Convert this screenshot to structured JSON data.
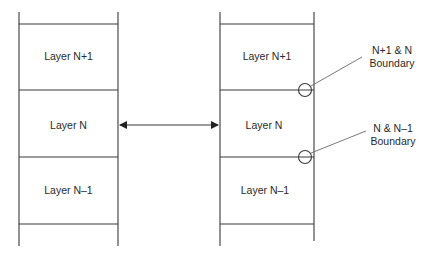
{
  "diagram": {
    "type": "protocol-layer-stack",
    "left_stack": {
      "layers": [
        {
          "label": "Layer N+1"
        },
        {
          "label": "Layer N"
        },
        {
          "label": "Layer N–1"
        }
      ]
    },
    "right_stack": {
      "layers": [
        {
          "label": "Layer N+1"
        },
        {
          "label": "Layer N"
        },
        {
          "label": "Layer N–1"
        }
      ]
    },
    "connector": {
      "type": "double-arrow",
      "between": "Layer N (left) and Layer N (right)"
    },
    "callouts": [
      {
        "line1": "N+1 & N",
        "line2": "Boundary"
      },
      {
        "line1": "N & N–1",
        "line2": "Boundary"
      }
    ],
    "colors": {
      "line": "#3a3a3a",
      "leader": "#6a6a6a",
      "text": "#2a2a2a",
      "background": "#ffffff"
    }
  }
}
